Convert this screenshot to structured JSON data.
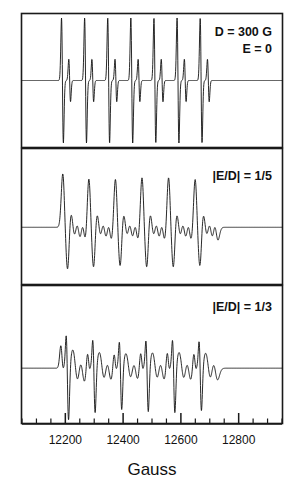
{
  "figure": {
    "type": "epr-spectra-figure"
  },
  "axis": {
    "title": "Gauss",
    "tick_labels": [
      "12200",
      "12400",
      "12600",
      "12800"
    ],
    "tick_values": [
      12200,
      12400,
      12600,
      12800
    ],
    "minor_tick_count_between": 3,
    "range_min": 12050,
    "range_max": 12950
  },
  "panels": [
    {
      "id": "panel-top",
      "annotation_lines": [
        "D = 300 G",
        "E = 0"
      ],
      "annotation_text": "D = 300 G / E = 0"
    },
    {
      "id": "panel-middle",
      "annotation_lines": [
        "|E/D| = 1/5"
      ],
      "annotation_text": "|E/D| = 1/5"
    },
    {
      "id": "panel-bottom",
      "annotation_lines": [
        "|E/D| = 1/3"
      ],
      "annotation_text": "|E/D| = 1/3"
    }
  ],
  "colors": {
    "trace": "#111111",
    "frame": "#1a1a1a",
    "background": "#ffffff"
  },
  "chart_data": {
    "type": "line",
    "title": "",
    "xlabel": "Gauss",
    "ylabel": "",
    "xlim": [
      12050,
      12950
    ],
    "grid": false,
    "legend": "none",
    "panel_layout": "three stacked panels, shared x axis",
    "annotations": [
      "D = 300 G",
      "E = 0",
      "|E/D| = 1/5",
      "|E/D| = 1/3"
    ],
    "x_ticks": [
      12200,
      12400,
      12600,
      12800
    ],
    "series": [
      {
        "name": "D = 300 G, E = 0",
        "panel": "panel-top",
        "signal_start_x": 12185,
        "signal_end_x": 12745,
        "hyperfine_lines": 7,
        "line_spacing_gauss": 80,
        "peaks_x": [
          12190,
          12215,
          12270,
          12295,
          12350,
          12375,
          12430,
          12455,
          12510,
          12535,
          12590,
          12615,
          12670,
          12695
        ],
        "peak_amplitudes": [
          1.0,
          0.38,
          1.0,
          0.38,
          1.0,
          0.38,
          1.0,
          0.38,
          1.0,
          0.38,
          1.0,
          0.38,
          1.0,
          0.38
        ],
        "lineshape": "sharp first-derivative, narrow linewidth"
      },
      {
        "name": "|E/D| = 1/5",
        "panel": "panel-middle",
        "signal_start_x": 12185,
        "signal_end_x": 12745,
        "hyperfine_lines": 6,
        "line_spacing_gauss": 92,
        "peaks_x": [
          12200,
          12290,
          12382,
          12474,
          12566,
          12658
        ],
        "peak_amplitudes": [
          1.0,
          0.95,
          0.92,
          0.95,
          0.95,
          0.92
        ],
        "lineshape": "broadened, split-top peaks with structured shoulders"
      },
      {
        "name": "|E/D| = 1/3",
        "panel": "panel-bottom",
        "signal_start_x": 12185,
        "signal_end_x": 12745,
        "hyperfine_lines": 6,
        "line_spacing_gauss": 92,
        "peaks_x": [
          12205,
          12297,
          12389,
          12481,
          12573,
          12665
        ],
        "peak_amplitudes": [
          1.0,
          0.86,
          0.8,
          0.84,
          0.86,
          0.82
        ],
        "lineshape": "asymmetric derivative with shoulder before each main peak"
      }
    ]
  }
}
